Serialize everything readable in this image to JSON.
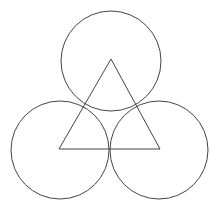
{
  "diagram": {
    "width": 218,
    "height": 210,
    "background": "#ffffff",
    "stroke_color": "#444444",
    "stroke_width": 1,
    "circles": [
      {
        "name": "top-circle",
        "cx": 111,
        "cy": 61,
        "r": 50
      },
      {
        "name": "left-circle",
        "cx": 60,
        "cy": 150,
        "r": 49
      },
      {
        "name": "right-circle",
        "cx": 159,
        "cy": 150,
        "r": 49
      }
    ],
    "triangle": {
      "name": "equilateral-triangle",
      "points": [
        [
          111,
          59
        ],
        [
          59,
          149
        ],
        [
          160,
          149
        ]
      ]
    }
  }
}
